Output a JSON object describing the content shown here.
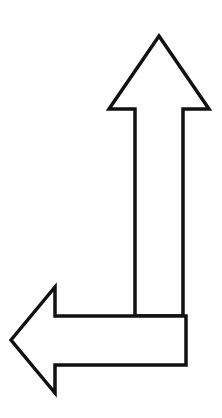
{
  "diagram": {
    "arrows": [
      {
        "direction": "up",
        "label": ""
      },
      {
        "direction": "left",
        "label": ""
      }
    ],
    "colors": {
      "stroke": "#111111",
      "fill": "#ffffff",
      "background": "#ffffff"
    }
  }
}
